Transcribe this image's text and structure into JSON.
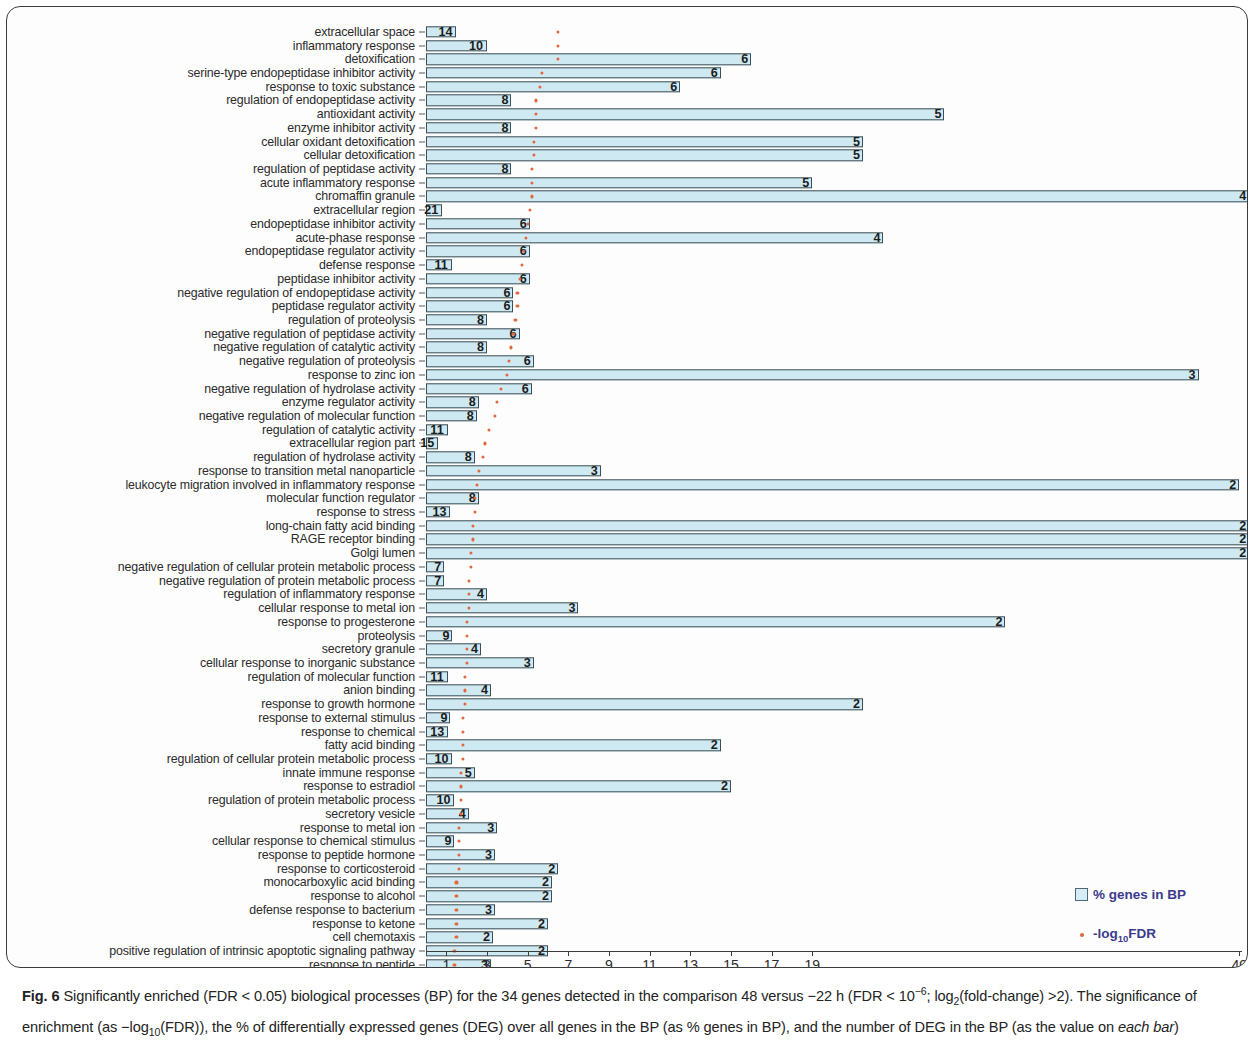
{
  "figure": {
    "label": "Fig. 6",
    "caption_part1": " Significantly enriched (FDR < 0.05) biological processes (BP) for the 34 genes detected in the comparison 48 versus −22 h (FDR < 10",
    "caption_sup1": "−6",
    "caption_part2": "; log",
    "caption_sub1": "2",
    "caption_part3": "(fold-change) >2). The significance of enrichment (as −log",
    "caption_sub2": "10",
    "caption_part4": "(FDR)), the % of differentially expressed genes (DEG) over all genes in the BP (as % genes in BP), and the number of DEG in the BP (as the value on ",
    "caption_italic": "each bar",
    "caption_part5": ")"
  },
  "legend": {
    "items": [
      {
        "icon": "square-swatch",
        "label_pre": "% genes in BP",
        "label_sub": "",
        "label_post": "",
        "color": "#d6edf5"
      },
      {
        "icon": "dot",
        "label_pre": "-log",
        "label_sub": "10",
        "label_post": "FDR",
        "color": "#e2683c"
      }
    ]
  },
  "axis": {
    "tick_labels": [
      "1",
      "3",
      "5",
      "7",
      "9",
      "11",
      "13",
      "15",
      "17",
      "19",
      "40"
    ],
    "tick_values": [
      1,
      3,
      5,
      7,
      9,
      11,
      13,
      15,
      17,
      19,
      40
    ],
    "min": 0,
    "max": 40.8
  },
  "colors": {
    "bar_fill": "#cfe9f2",
    "bar_stroke": "#3d4f55",
    "fdr_dot": "#e2683c",
    "legend_text": "#3b3b8c",
    "frame": "#3c3c3c"
  },
  "chart_data": {
    "type": "bar",
    "orientation": "horizontal",
    "title": "",
    "xlabel": "",
    "ylabel": "",
    "xlim": [
      0,
      40.8
    ],
    "grid": false,
    "legend_position": "bottom-right",
    "categories": [
      "extracellular space",
      "inflammatory response",
      "detoxification",
      "serine-type endopeptidase inhibitor activity",
      "response to toxic substance",
      "regulation of endopeptidase activity",
      "antioxidant activity",
      "enzyme inhibitor activity",
      "cellular oxidant detoxification",
      "cellular detoxification",
      "regulation of peptidase activity",
      "acute inflammatory response",
      "chromaffin granule",
      "extracellular region",
      "endopeptidase inhibitor activity",
      "acute-phase response",
      "endopeptidase regulator activity",
      "defense response",
      "peptidase inhibitor activity",
      "negative regulation of endopeptidase activity",
      "peptidase regulator activity",
      "regulation of proteolysis",
      "negative regulation of peptidase activity",
      "negative regulation of catalytic activity",
      "negative regulation of proteolysis",
      "response to zinc ion",
      "negative regulation of hydrolase activity",
      "enzyme regulator activity",
      "negative regulation of molecular function",
      "regulation of catalytic activity",
      "extracellular region part",
      "regulation of hydrolase activity",
      "response to transition metal nanoparticle",
      "leukocyte migration involved in inflammatory response",
      "molecular function regulator",
      "response to stress",
      "long-chain fatty acid binding",
      "RAGE receptor binding",
      "Golgi lumen",
      "negative regulation of cellular protein metabolic process",
      "negative regulation of protein metabolic process",
      "regulation of inflammatory response",
      "cellular response to metal ion",
      "response to progesterone",
      "proteolysis",
      "secretory granule",
      "cellular response to inorganic substance",
      "regulation of molecular function",
      "anion binding",
      "response to growth hormone",
      "response to external stimulus",
      "response to chemical",
      "fatty acid binding",
      "regulation of cellular protein metabolic process",
      "innate immune response",
      "response to estradiol",
      "regulation of protein metabolic process",
      "secretory vesicle",
      "response to metal ion",
      "cellular response to chemical stimulus",
      "response to peptide hormone",
      "response to corticosteroid",
      "monocarboxylic acid binding",
      "response to alcohol",
      "defense response to bacterium",
      "response to ketone",
      "cell chemotaxis",
      "positive regulation of intrinsic apoptotic signaling pathway",
      "response to peptide",
      "myeloid cell activation involved in immune response"
    ],
    "series": [
      {
        "name": "% genes in BP",
        "unit": "%",
        "values": [
          1.5,
          3.0,
          16.0,
          14.5,
          12.5,
          4.2,
          25.5,
          4.2,
          21.5,
          21.5,
          4.2,
          19.0,
          40.5,
          0.8,
          5.1,
          22.5,
          5.1,
          1.3,
          5.1,
          4.3,
          4.3,
          3.0,
          4.6,
          3.0,
          5.3,
          38.0,
          5.2,
          2.6,
          2.5,
          1.1,
          0.6,
          2.4,
          8.6,
          40.0,
          2.6,
          1.2,
          40.5,
          40.5,
          40.5,
          0.9,
          0.9,
          3.0,
          7.5,
          28.5,
          1.3,
          2.7,
          5.3,
          1.1,
          3.2,
          21.5,
          1.2,
          1.1,
          14.5,
          1.3,
          2.4,
          15.0,
          1.4,
          2.1,
          3.5,
          1.4,
          3.4,
          6.5,
          6.2,
          6.2,
          3.4,
          6.0,
          3.3,
          6.0,
          3.2,
          6.0
        ]
      },
      {
        "name": "-log10FDR",
        "unit": "",
        "values": [
          6.5,
          6.5,
          6.5,
          5.7,
          5.6,
          5.4,
          5.4,
          5.4,
          5.3,
          5.3,
          5.2,
          5.2,
          5.2,
          5.1,
          5.0,
          4.9,
          4.8,
          4.7,
          4.6,
          4.5,
          4.5,
          4.4,
          4.3,
          4.2,
          4.1,
          4.0,
          3.7,
          3.5,
          3.4,
          3.1,
          2.9,
          2.8,
          2.6,
          2.5,
          2.4,
          2.4,
          2.3,
          2.3,
          2.2,
          2.2,
          2.1,
          2.1,
          2.1,
          2.0,
          2.0,
          2.0,
          2.0,
          1.9,
          1.9,
          1.9,
          1.8,
          1.8,
          1.8,
          1.8,
          1.7,
          1.7,
          1.7,
          1.7,
          1.6,
          1.6,
          1.6,
          1.6,
          1.5,
          1.5,
          1.5,
          1.5,
          1.5,
          1.4,
          1.4,
          1.4
        ]
      }
    ],
    "bar_labels": [
      "14",
      "10",
      "6",
      "6",
      "6",
      "8",
      "5",
      "8",
      "5",
      "5",
      "8",
      "5",
      "4",
      "21",
      "6",
      "4",
      "6",
      "11",
      "6",
      "6",
      "6",
      "8",
      "6",
      "8",
      "6",
      "3",
      "6",
      "8",
      "8",
      "11",
      "15",
      "8",
      "3",
      "2",
      "8",
      "13",
      "2",
      "2",
      "2",
      "7",
      "7",
      "4",
      "3",
      "2",
      "9",
      "4",
      "3",
      "11",
      "4",
      "2",
      "9",
      "13",
      "2",
      "10",
      "5",
      "2",
      "10",
      "4",
      "3",
      "9",
      "3",
      "2",
      "2",
      "2",
      "3",
      "2",
      "2",
      "2",
      "3",
      "2"
    ]
  }
}
